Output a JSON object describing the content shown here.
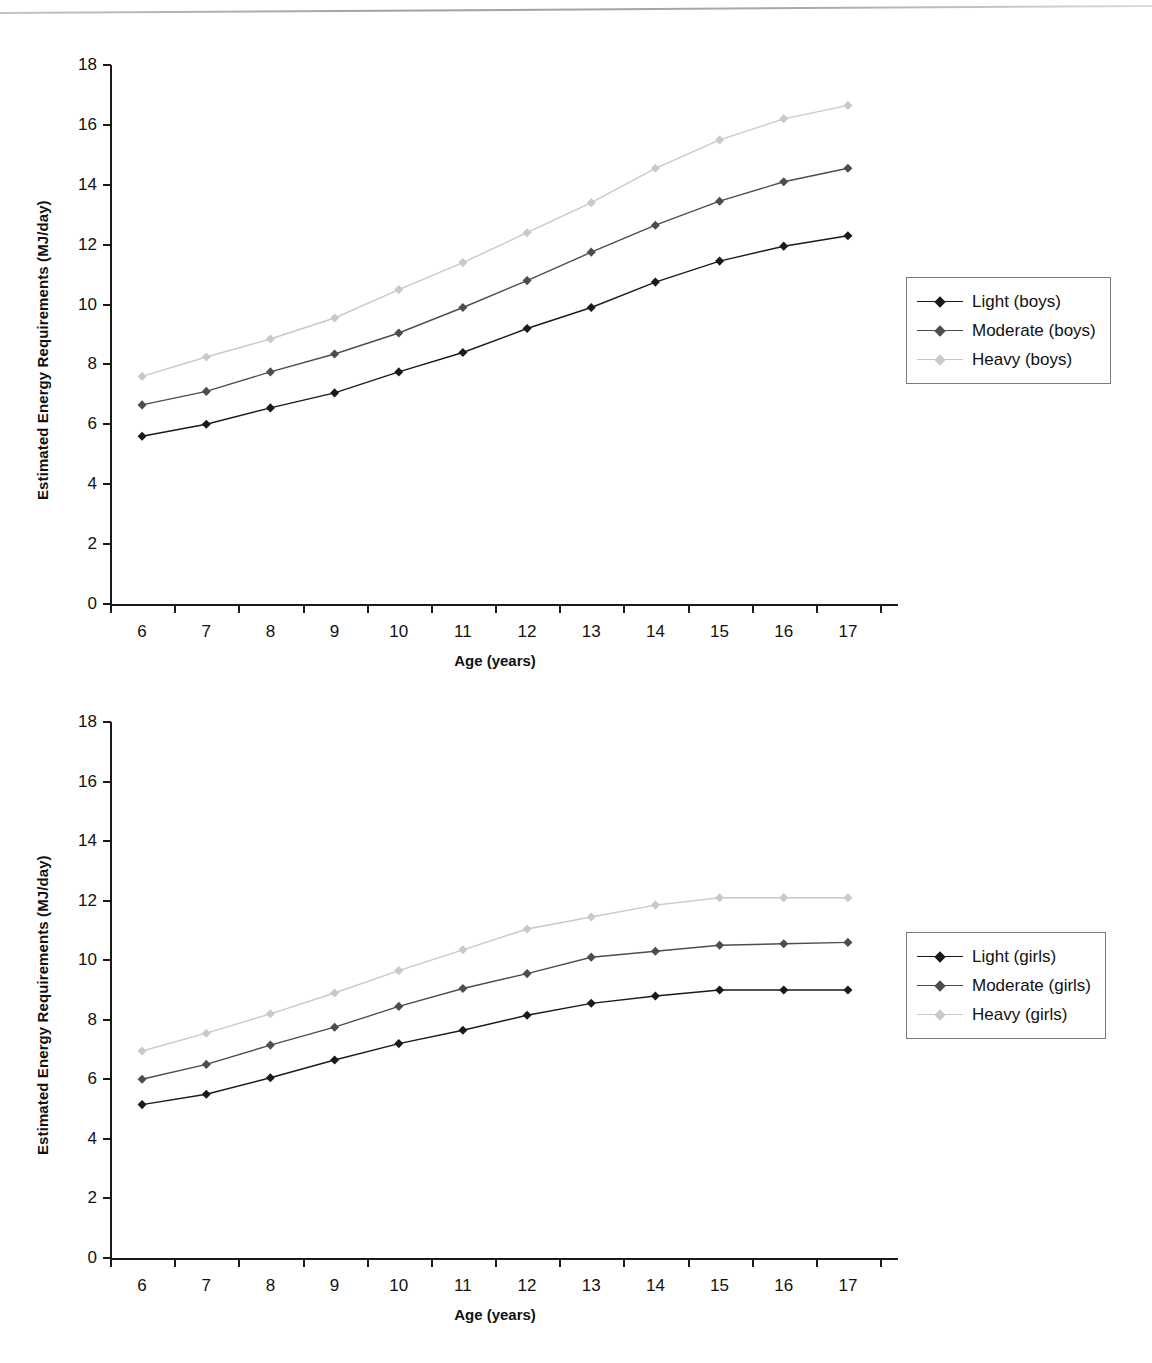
{
  "figure": {
    "shared_xlabel": "Age (years)",
    "shared_ylabel": "Estimated Energy Requirements (MJ/day)"
  },
  "colors": {
    "light": "#1a1a1a",
    "moderate": "#4d4d4d",
    "heavy": "#c9c9c9",
    "axis": "#1a1a1a",
    "legend_border": "#7b7b7b",
    "background": "#ffffff"
  },
  "charts": {
    "boys": {
      "title": "",
      "xlabel": "Age (years)",
      "ylabel": "Estimated Energy Requirements (MJ/day)",
      "ytick_labels": [
        "18",
        "16",
        "14",
        "12",
        "10",
        "8",
        "6",
        "4",
        "2",
        "0"
      ],
      "xtick_labels": [
        "6",
        "7",
        "8",
        "9",
        "10",
        "11",
        "12",
        "13",
        "14",
        "15",
        "16",
        "17"
      ],
      "legend": {
        "position": "right",
        "items": [
          {
            "label": "Light (boys)",
            "color": "#1a1a1a"
          },
          {
            "label": "Moderate  (boys)",
            "color": "#4d4d4d"
          },
          {
            "label": "Heavy (boys)",
            "color": "#c9c9c9"
          }
        ]
      }
    },
    "girls": {
      "title": "",
      "xlabel": "Age (years)",
      "ylabel": "Estimated Energy Requirements (MJ/day)",
      "ytick_labels": [
        "18",
        "16",
        "14",
        "12",
        "10",
        "8",
        "6",
        "4",
        "2",
        "0"
      ],
      "xtick_labels": [
        "6",
        "7",
        "8",
        "9",
        "10",
        "11",
        "12",
        "13",
        "14",
        "15",
        "16",
        "17"
      ],
      "legend": {
        "position": "right",
        "items": [
          {
            "label": "Light (girls)",
            "color": "#1a1a1a"
          },
          {
            "label": "Moderate (girls)",
            "color": "#4d4d4d"
          },
          {
            "label": "Heavy (girls)",
            "color": "#c9c9c9"
          }
        ]
      }
    }
  },
  "chart_data": [
    {
      "type": "line",
      "id": "boys",
      "title": "",
      "xlabel": "Age (years)",
      "ylabel": "Estimated Energy Requirements (MJ/day)",
      "categories": [
        6,
        7,
        8,
        9,
        10,
        11,
        12,
        13,
        14,
        15,
        16,
        17
      ],
      "xlim": [
        6,
        17
      ],
      "ylim": [
        0,
        18
      ],
      "yticks": [
        0,
        2,
        4,
        6,
        8,
        10,
        12,
        14,
        16,
        18
      ],
      "grid": false,
      "legend_position": "right",
      "series": [
        {
          "name": "Light (boys)",
          "color": "#1a1a1a",
          "values": [
            5.6,
            6.0,
            6.55,
            7.05,
            7.75,
            8.4,
            9.2,
            9.9,
            10.75,
            11.45,
            11.95,
            12.3
          ]
        },
        {
          "name": "Moderate  (boys)",
          "color": "#4d4d4d",
          "values": [
            6.65,
            7.1,
            7.75,
            8.35,
            9.05,
            9.9,
            10.8,
            11.75,
            12.65,
            13.45,
            14.1,
            14.55
          ]
        },
        {
          "name": "Heavy (boys)",
          "color": "#c9c9c9",
          "values": [
            7.6,
            8.25,
            8.85,
            9.55,
            10.5,
            11.4,
            12.4,
            13.4,
            14.55,
            15.5,
            16.2,
            16.65
          ]
        }
      ]
    },
    {
      "type": "line",
      "id": "girls",
      "title": "",
      "xlabel": "Age (years)",
      "ylabel": "Estimated Energy Requirements (MJ/day)",
      "categories": [
        6,
        7,
        8,
        9,
        10,
        11,
        12,
        13,
        14,
        15,
        16,
        17
      ],
      "xlim": [
        6,
        17
      ],
      "ylim": [
        0,
        18
      ],
      "yticks": [
        0,
        2,
        4,
        6,
        8,
        10,
        12,
        14,
        16,
        18
      ],
      "grid": false,
      "legend_position": "right",
      "series": [
        {
          "name": "Light (girls)",
          "color": "#1a1a1a",
          "values": [
            5.15,
            5.5,
            6.05,
            6.65,
            7.2,
            7.65,
            8.15,
            8.55,
            8.8,
            9.0,
            9.0,
            9.0
          ]
        },
        {
          "name": "Moderate (girls)",
          "color": "#4d4d4d",
          "values": [
            6.0,
            6.5,
            7.15,
            7.75,
            8.45,
            9.05,
            9.55,
            10.1,
            10.3,
            10.5,
            10.55,
            10.6
          ]
        },
        {
          "name": "Heavy (girls)",
          "color": "#c9c9c9",
          "values": [
            6.95,
            7.55,
            8.2,
            8.9,
            9.65,
            10.35,
            11.05,
            11.45,
            11.85,
            12.1,
            12.1,
            12.1
          ]
        }
      ]
    }
  ]
}
